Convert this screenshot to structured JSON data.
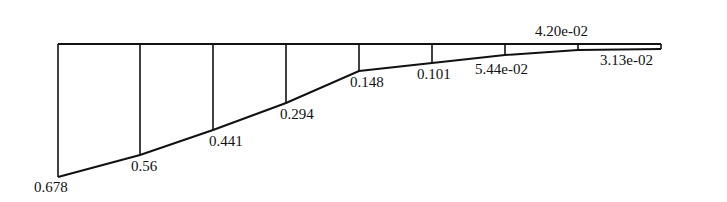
{
  "diagram": {
    "type": "distribution-diagram",
    "baseline": {
      "x_start": 58,
      "x_end": 661,
      "y": 44
    },
    "stations": [
      {
        "x": 58,
        "y": 177,
        "value": "0.678",
        "label_x": 34,
        "label_y": 180,
        "label_pos": "below"
      },
      {
        "x": 140,
        "y": 155,
        "value": "0.56",
        "label_x": 131,
        "label_y": 159,
        "label_pos": "below"
      },
      {
        "x": 213,
        "y": 130,
        "value": "0.441",
        "label_x": 209,
        "label_y": 134,
        "label_pos": "below"
      },
      {
        "x": 286,
        "y": 103,
        "value": "0.294",
        "label_x": 280,
        "label_y": 107,
        "label_pos": "below"
      },
      {
        "x": 359,
        "y": 71,
        "value": "0.148",
        "label_x": 350,
        "label_y": 75,
        "label_pos": "below"
      },
      {
        "x": 432,
        "y": 63,
        "value": "0.101",
        "label_x": 417,
        "label_y": 67,
        "label_pos": "below"
      },
      {
        "x": 505,
        "y": 55,
        "value": "5.44e-02",
        "label_x": 475,
        "label_y": 62,
        "label_pos": "below"
      },
      {
        "x": 578,
        "y": 50,
        "value": "4.20e-02",
        "label_x": 535,
        "label_y": 24,
        "label_pos": "above"
      },
      {
        "x": 661,
        "y": 49,
        "value": "3.13e-02",
        "label_x": 600,
        "label_y": 53,
        "label_pos": "below"
      }
    ]
  }
}
